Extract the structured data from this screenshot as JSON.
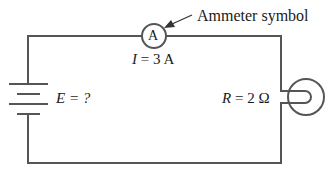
{
  "diagram": {
    "type": "circuit",
    "annotation": "Ammeter symbol",
    "ammeter": {
      "symbol": "A",
      "label_var": "I",
      "label_rest": " = 3 A"
    },
    "battery": {
      "label_var": "E",
      "label_rest": " = ?"
    },
    "resistor_bulb": {
      "label_var": "R",
      "label_rest": " = 2 Ω"
    },
    "colors": {
      "wire": "#555555",
      "text": "#1a1a1a",
      "background": "#ffffff"
    }
  }
}
